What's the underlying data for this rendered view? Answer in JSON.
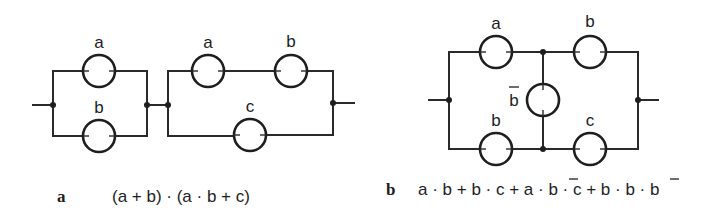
{
  "diagram_a": {
    "caption_letter": "a",
    "formula": "(a + b) · (a · b + c)",
    "switch_labels": {
      "p1_top": "a",
      "p1_bottom": "b",
      "p2_top_left": "a",
      "p2_top_right": "b",
      "p2_bottom": "c"
    }
  },
  "diagram_b": {
    "caption_letter": "b",
    "formula_parts": {
      "p1": "a · b + b · c + a · ",
      "p2": "b",
      "p3": " · c + b · ",
      "p4": "b",
      "p5": " · b"
    },
    "switch_labels": {
      "top_left": "a",
      "top_right": "b",
      "bridge": "b",
      "bottom_left": "b",
      "bottom_right": "c"
    }
  },
  "colors": {
    "ink": "#1e1e1e",
    "background": "#ffffff"
  }
}
